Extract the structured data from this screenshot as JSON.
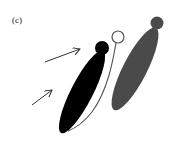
{
  "figure": {
    "panel_label": "(c)",
    "colors": {
      "black_shape": "#000000",
      "gray_shape": "#4a4a4a",
      "outline": "#555555",
      "arrow": "#333333",
      "background": "#ffffff"
    },
    "elements": {
      "black_body": {
        "cx": 82,
        "cy": 92,
        "rx": 11,
        "ry": 46,
        "rotate": 27
      },
      "black_head": {
        "cx": 102,
        "cy": 48,
        "r": 7
      },
      "open_circle": {
        "cx": 118,
        "cy": 37,
        "r": 6
      },
      "gray_body": {
        "cx": 135,
        "cy": 69,
        "rx": 12,
        "ry": 46,
        "rotate": 27
      },
      "gray_head": {
        "cx": 157,
        "cy": 23,
        "r": 6.5
      },
      "arrow_top": {
        "x1": 45,
        "y1": 62,
        "x2": 80,
        "y2": 49
      },
      "arrow_bottom": {
        "x1": 32,
        "y1": 105,
        "x2": 52,
        "y2": 90
      }
    }
  }
}
